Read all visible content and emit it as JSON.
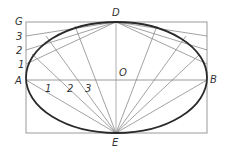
{
  "diagram": {
    "labels": {
      "G": "G",
      "three_left": "3",
      "two_left": "2",
      "one_left": "1",
      "A": "A",
      "D": "D",
      "O": "O",
      "B": "B",
      "E": "E",
      "one_axis": "1",
      "two_axis": "2",
      "three_axis": "3"
    },
    "colors": {
      "ellipse": "#2a2a2a",
      "construction": "#8a8a8a",
      "frame": "#9a9a9a",
      "text": "#333333"
    }
  }
}
